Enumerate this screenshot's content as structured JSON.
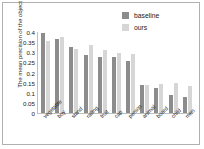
{
  "chart_data": {
    "type": "bar",
    "title": "",
    "xlabel": "",
    "ylabel": "The mean precision of the object",
    "ylim": [
      0,
      0.4
    ],
    "grid": false,
    "legend_position": "top-right",
    "yticks": [
      "0.4",
      "0.35",
      "0.3",
      "0.25",
      "0.2",
      "0.15",
      "0.1",
      "0.05",
      "0"
    ],
    "ytick_values": [
      0.4,
      0.35,
      0.3,
      0.25,
      0.2,
      0.15,
      0.1,
      0.05,
      0
    ],
    "categories": [
      "vegetable",
      "boy",
      "stand",
      "railing",
      "fruit",
      "cap",
      "person",
      "animal",
      "board",
      "child",
      "men"
    ],
    "series": [
      {
        "name": "baseline",
        "color": "#8c8c8c",
        "values": [
          0.395,
          0.365,
          0.325,
          0.285,
          0.275,
          0.275,
          0.255,
          0.14,
          0.125,
          0.09,
          0.08
        ]
      },
      {
        "name": "ours",
        "color": "#d6d6d6",
        "values": [
          0.355,
          0.375,
          0.315,
          0.335,
          0.31,
          0.295,
          0.29,
          0.14,
          0.145,
          0.15,
          0.135
        ]
      }
    ]
  },
  "legend": {
    "items": [
      {
        "label": "baseline",
        "color": "#8c8c8c"
      },
      {
        "label": "ours",
        "color": "#d6d6d6"
      }
    ]
  }
}
